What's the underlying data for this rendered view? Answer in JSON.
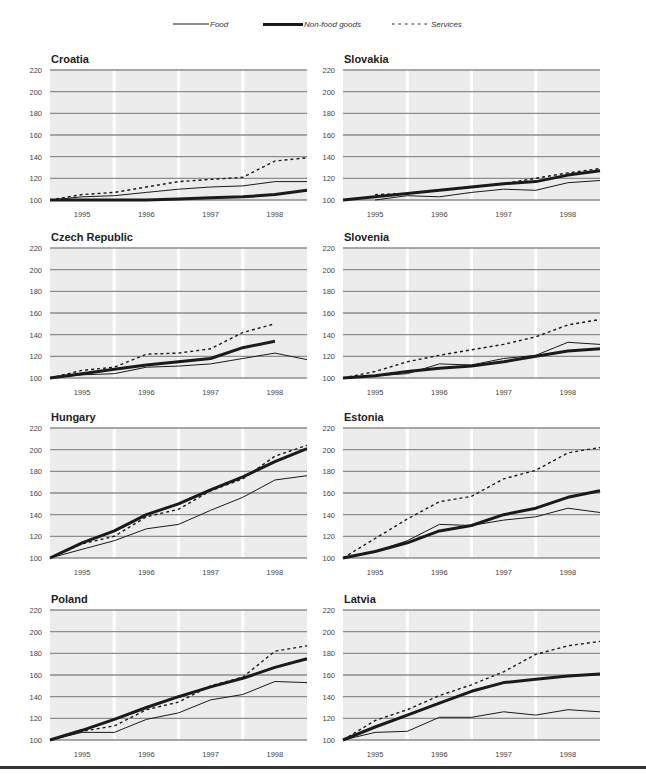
{
  "legend": {
    "items": [
      {
        "label": "Food",
        "style": "solid-thin"
      },
      {
        "label": "Non-food goods",
        "style": "solid-thick"
      },
      {
        "label": "Services",
        "style": "dashed"
      }
    ]
  },
  "axis": {
    "y_ticks": [
      "220",
      "200",
      "180",
      "160",
      "140",
      "120",
      "100"
    ],
    "x_ticks": [
      "1995",
      "1996",
      "1997",
      "1998"
    ]
  },
  "colors": {
    "line": "#1a1a1a",
    "grid": "#8c8c8c",
    "band": "#ececec",
    "rule": "#333333"
  },
  "chart_data": [
    {
      "type": "line",
      "title": "Croatia",
      "xlabel": "",
      "ylabel": "",
      "categories": [
        "1995",
        "1996",
        "1997",
        "1998"
      ],
      "ylim": [
        100,
        220
      ],
      "x": [
        0,
        0.5,
        1,
        1.5,
        2,
        2.5,
        3,
        3.5,
        4
      ],
      "series": [
        {
          "name": "Food",
          "values": [
            100,
            103,
            104,
            107,
            110,
            112,
            113,
            117,
            117
          ]
        },
        {
          "name": "Non-food goods",
          "values": [
            100,
            100,
            100,
            100,
            101,
            102,
            103,
            105,
            109
          ]
        },
        {
          "name": "Services",
          "values": [
            100,
            105,
            107,
            112,
            117,
            119,
            121,
            136,
            139
          ]
        }
      ]
    },
    {
      "type": "line",
      "title": "Slovakia",
      "xlabel": "",
      "ylabel": "",
      "categories": [
        "1995",
        "1996",
        "1997",
        "1998"
      ],
      "ylim": [
        100,
        220
      ],
      "x": [
        0,
        0.5,
        1,
        1.5,
        2,
        2.5,
        3,
        3.5,
        4
      ],
      "series": [
        {
          "name": "Food",
          "values": [
            null,
            100,
            104,
            103,
            107,
            110,
            109,
            116,
            118
          ]
        },
        {
          "name": "Non-food goods",
          "values": [
            100,
            103,
            106,
            109,
            112,
            115,
            117,
            123,
            127
          ]
        },
        {
          "name": "Services",
          "values": [
            null,
            105,
            106,
            109,
            112,
            115,
            120,
            125,
            129
          ]
        }
      ]
    },
    {
      "type": "line",
      "title": "Czech Republic",
      "xlabel": "",
      "ylabel": "",
      "categories": [
        "1995",
        "1996",
        "1997",
        "1998"
      ],
      "ylim": [
        100,
        220
      ],
      "x": [
        0,
        0.5,
        1,
        1.5,
        2,
        2.5,
        3,
        3.5,
        4
      ],
      "series": [
        {
          "name": "Food",
          "values": [
            100,
            103,
            104,
            110,
            111,
            113,
            118,
            123,
            117
          ]
        },
        {
          "name": "Non-food goods",
          "values": [
            100,
            104,
            108,
            112,
            115,
            118,
            128,
            134,
            null
          ]
        },
        {
          "name": "Services",
          "values": [
            100,
            107,
            110,
            122,
            123,
            127,
            142,
            150,
            null
          ]
        }
      ]
    },
    {
      "type": "line",
      "title": "Slovenia",
      "xlabel": "",
      "ylabel": "",
      "categories": [
        "1995",
        "1996",
        "1997",
        "1998"
      ],
      "ylim": [
        100,
        220
      ],
      "x": [
        0,
        0.5,
        1,
        1.5,
        2,
        2.5,
        3,
        3.5,
        4
      ],
      "series": [
        {
          "name": "Food",
          "values": [
            100,
            102,
            104,
            113,
            112,
            118,
            121,
            133,
            131
          ]
        },
        {
          "name": "Non-food goods",
          "values": [
            100,
            102,
            106,
            109,
            111,
            115,
            120,
            125,
            127
          ]
        },
        {
          "name": "Services",
          "values": [
            100,
            106,
            115,
            121,
            126,
            131,
            138,
            149,
            154
          ]
        }
      ]
    },
    {
      "type": "line",
      "title": "Hungary",
      "xlabel": "",
      "ylabel": "",
      "categories": [
        "1995",
        "1996",
        "1997",
        "1998"
      ],
      "ylim": [
        100,
        220
      ],
      "x": [
        0,
        0.5,
        1,
        1.5,
        2,
        2.5,
        3,
        3.5,
        4
      ],
      "series": [
        {
          "name": "Food",
          "values": [
            100,
            108,
            116,
            127,
            131,
            144,
            156,
            172,
            176
          ]
        },
        {
          "name": "Non-food goods",
          "values": [
            100,
            114,
            125,
            140,
            150,
            163,
            175,
            189,
            201
          ]
        },
        {
          "name": "Services",
          "values": [
            100,
            113,
            120,
            138,
            145,
            162,
            173,
            194,
            204
          ]
        }
      ]
    },
    {
      "type": "line",
      "title": "Estonia",
      "xlabel": "",
      "ylabel": "",
      "categories": [
        "1995",
        "1996",
        "1997",
        "1998"
      ],
      "ylim": [
        100,
        220
      ],
      "x": [
        0,
        0.5,
        1,
        1.5,
        2,
        2.5,
        3,
        3.5,
        4
      ],
      "series": [
        {
          "name": "Food",
          "values": [
            100,
            106,
            116,
            131,
            130,
            135,
            138,
            146,
            142
          ]
        },
        {
          "name": "Non-food goods",
          "values": [
            100,
            106,
            114,
            125,
            130,
            140,
            146,
            156,
            162
          ]
        },
        {
          "name": "Services",
          "values": [
            100,
            118,
            136,
            152,
            157,
            173,
            181,
            197,
            202
          ]
        }
      ]
    },
    {
      "type": "line",
      "title": "Poland",
      "xlabel": "",
      "ylabel": "",
      "categories": [
        "1995",
        "1996",
        "1997",
        "1998"
      ],
      "ylim": [
        100,
        220
      ],
      "x": [
        0,
        0.5,
        1,
        1.5,
        2,
        2.5,
        3,
        3.5,
        4
      ],
      "series": [
        {
          "name": "Food",
          "values": [
            100,
            107,
            107,
            119,
            125,
            137,
            142,
            154,
            153
          ]
        },
        {
          "name": "Non-food goods",
          "values": [
            100,
            109,
            119,
            130,
            140,
            149,
            157,
            167,
            175
          ]
        },
        {
          "name": "Services",
          "values": [
            100,
            108,
            113,
            128,
            135,
            150,
            158,
            182,
            187
          ]
        }
      ]
    },
    {
      "type": "line",
      "title": "Latvia",
      "xlabel": "",
      "ylabel": "",
      "categories": [
        "1995",
        "1996",
        "1997",
        "1998"
      ],
      "ylim": [
        100,
        220
      ],
      "x": [
        0,
        0.5,
        1,
        1.5,
        2,
        2.5,
        3,
        3.5,
        4
      ],
      "series": [
        {
          "name": "Food",
          "values": [
            100,
            107,
            108,
            121,
            121,
            126,
            123,
            128,
            126
          ]
        },
        {
          "name": "Non-food goods",
          "values": [
            100,
            112,
            123,
            134,
            145,
            153,
            156,
            159,
            161
          ]
        },
        {
          "name": "Services",
          "values": [
            100,
            118,
            128,
            141,
            151,
            163,
            179,
            187,
            191
          ]
        }
      ]
    }
  ]
}
